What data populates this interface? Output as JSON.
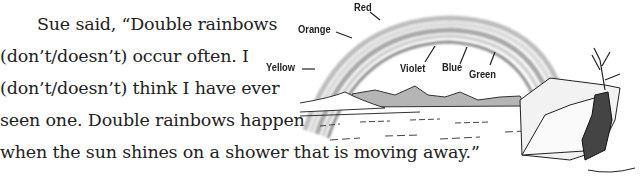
{
  "passage": {
    "lines": [
      "Sue said, “Double rainbows",
      "(don’t/doesn’t) occur often. I",
      "(don’t/doesn’t) think I have ever",
      "seen one. Double rainbows happen",
      "when the sun shines on a shower that is moving away.”"
    ]
  },
  "figure": {
    "labels": {
      "red": "Red",
      "orange": "Orange",
      "yellow": "Yellow",
      "violet": "Violet",
      "blue": "Blue",
      "green": "Green"
    }
  }
}
